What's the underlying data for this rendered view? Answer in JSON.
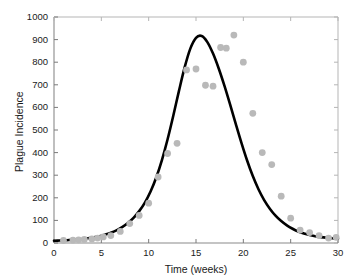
{
  "chart_data": {
    "type": "scatter",
    "title": "",
    "xlabel": "Time (weeks)",
    "ylabel": "Plague Incidence",
    "xlim": [
      0,
      30
    ],
    "ylim": [
      0,
      1000
    ],
    "xticks": [
      0,
      5,
      10,
      15,
      20,
      25,
      30
    ],
    "yticks": [
      0,
      100,
      200,
      300,
      400,
      500,
      600,
      700,
      800,
      900,
      1000
    ],
    "grid": false,
    "legend": null,
    "series": [
      {
        "name": "Observed plague incidence",
        "type": "scatter",
        "marker": "circle",
        "color": "#b9b9b9",
        "x": [
          1,
          2,
          2.6,
          3.2,
          4,
          4.6,
          5.2,
          6,
          7,
          8,
          9,
          10,
          11,
          12,
          13,
          14,
          15,
          16,
          16.8,
          17.6,
          18.2,
          19,
          20,
          21,
          22,
          23,
          24,
          25,
          26,
          27,
          28,
          29,
          29.8
        ],
        "y": [
          11,
          13,
          14,
          16,
          18,
          22,
          27,
          33,
          51,
          86,
          122,
          176,
          292,
          396,
          441,
          766,
          770,
          698,
          694,
          865,
          862,
          920,
          800,
          574,
          400,
          347,
          207,
          110,
          57,
          46,
          33,
          22,
          25
        ]
      },
      {
        "name": "Fitted curve",
        "type": "line",
        "color": "#000000",
        "peak_x": 16.8,
        "peak_y": 893,
        "x": [
          0,
          0.6,
          1.2,
          1.8,
          2.4,
          3,
          3.6,
          4.2,
          4.8,
          5.4,
          6,
          6.6,
          7.2,
          7.8,
          8.4,
          9,
          9.6,
          10.2,
          10.8,
          11.4,
          12,
          12.6,
          13.2,
          13.8,
          14.4,
          15,
          15.6,
          16.2,
          16.8,
          17.4,
          18,
          18.6,
          19.2,
          19.8,
          20.4,
          21,
          21.6,
          22.2,
          22.8,
          23.4,
          24,
          24.6,
          25.2,
          25.8,
          26.4,
          27,
          27.6,
          28.2,
          28.8,
          29.4,
          30
        ],
        "y": [
          10,
          11,
          12,
          14,
          16,
          18,
          21,
          25,
          30,
          37,
          45,
          56,
          70,
          88,
          111,
          141,
          179,
          228,
          290,
          367,
          459,
          563,
          673,
          777,
          860,
          908,
          916,
          889,
          838,
          772,
          696,
          613,
          527,
          443,
          365,
          296,
          238,
          190,
          152,
          121,
          97,
          78,
          63,
          51,
          42,
          35,
          30,
          26,
          23,
          21,
          19
        ]
      }
    ]
  },
  "axes": {
    "tick_color": "#7a7a7a",
    "frame_color": "#8a8a8a",
    "text_color": "#1a1a1a"
  }
}
